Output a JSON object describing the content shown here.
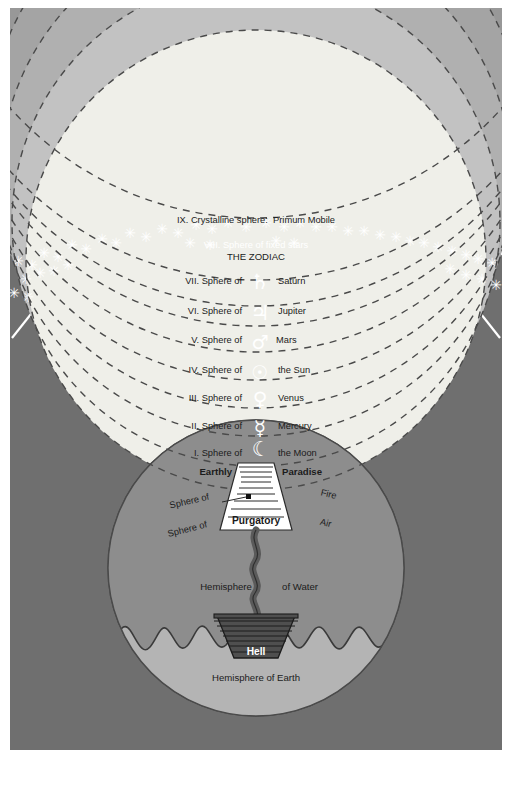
{
  "diagram": {
    "heaven_label": "Heaven",
    "spheres": [
      {
        "id": "ix",
        "number": "IX.",
        "name": "Crystalline sphere:  Primum Mobile",
        "full": "IX. Crystalline sphere:  Primum Mobile",
        "symbol": "",
        "body": "",
        "band_color": "#e8e6dd"
      },
      {
        "id": "viii",
        "number": "VIII.",
        "name": "Sphere of fixed stars",
        "full": "VIII. Sphere of fixed stars",
        "sub": "THE ZODIAC",
        "symbol": "",
        "body": "",
        "band_color": "#585858"
      },
      {
        "id": "vii",
        "number": "VII.",
        "name": "Sphere of",
        "full": "VII. Sphere of",
        "symbol": "♄",
        "body": "Saturn",
        "band_color": "#6a6a6a"
      },
      {
        "id": "vi",
        "number": "VI.",
        "name": "Sphere of",
        "full": "VI. Sphere of",
        "symbol": "♃",
        "body": "Jupiter",
        "band_color": "#757575"
      },
      {
        "id": "v",
        "number": "V.",
        "name": "Sphere of",
        "full": "V. Sphere of",
        "symbol": "♂",
        "body": "Mars",
        "band_color": "#818181"
      },
      {
        "id": "iv",
        "number": "IV.",
        "name": "Sphere of",
        "full": "IV. Sphere of",
        "symbol": "☉",
        "body": "the Sun",
        "band_color": "#8d8d8d"
      },
      {
        "id": "iii",
        "number": "III.",
        "name": "Sphere of",
        "full": "III. Sphere of",
        "symbol": "♀",
        "body": "Venus",
        "band_color": "#989898"
      },
      {
        "id": "ii",
        "number": "II.",
        "name": "Sphere of",
        "full": "II. Sphere of",
        "symbol": "☿",
        "body": "Mercury",
        "band_color": "#a4a4a4"
      },
      {
        "id": "i",
        "number": "I.",
        "name": "Sphere of",
        "full": "I. Sphere of",
        "symbol": "☾",
        "body": "the Moon",
        "band_color": "#b0b0b0"
      }
    ],
    "elemental_spheres": [
      {
        "id": "fire",
        "prefix": "Sphere of",
        "element": "Fire",
        "band_color": "#c2c2c2"
      },
      {
        "id": "air",
        "prefix": "Sphere of",
        "element": "Air",
        "band_color": "#efefe9"
      }
    ],
    "earth": {
      "earthly_paradise_left": "Earthly",
      "earthly_paradise_right": "Paradise",
      "purgatory_label": "Purgatory",
      "hell_label": "Hell",
      "hemisphere_water_left": "Hemisphere",
      "hemisphere_water_right": "of Water",
      "hemisphere_earth": "Hemisphere of Earth",
      "water_color": "#8d8d8d",
      "earth_color": "#b4b4b4"
    },
    "colors": {
      "empyrean": "#6f6f6f",
      "heaven_circle": "#ffffff",
      "spoke": "#ffffff",
      "arc_dark": "#3a3a3a",
      "dashed_boundary": "#4a4a4a",
      "star": "#ffffff",
      "text": "#1b1b1b",
      "hell_fill": "#4f4f4f",
      "purgatory_fill": "#ffffff",
      "page_background": "#ffffff"
    }
  }
}
